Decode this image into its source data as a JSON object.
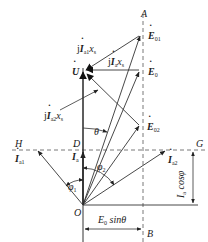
{
  "diagram": {
    "type": "phasor-diagram",
    "points": {
      "O": "O",
      "A": "A",
      "B": "B",
      "D": "D",
      "G": "G",
      "H": "H"
    },
    "phasors": {
      "U": "U",
      "E0": "E",
      "E0_sub": "0",
      "E01": "E",
      "E01_sub": "01",
      "E02": "E",
      "E02_sub": "02",
      "Ia": "I",
      "Ia_sub": "a",
      "Ia1": "I",
      "Ia1_sub": "a1",
      "Ia2": "I",
      "Ia2_sub": "a2"
    },
    "voltage_drops": {
      "jIa1xs_j": "j",
      "jIa1xs_I": "I",
      "jIa1xs_sub": "a1",
      "jIa1xs_x": "x",
      "jIa1xs_xsub": "s",
      "jIaxs_j": "j",
      "jIaxs_I": "I",
      "jIaxs_sub": "a",
      "jIaxs_x": "x",
      "jIaxs_xsub": "s",
      "jIa2xs_j": "j",
      "jIa2xs_I": "I",
      "jIa2xs_sub": "a2",
      "jIa2xs_x": "x",
      "jIa2xs_xsub": "s"
    },
    "angles": {
      "theta": "θ",
      "phi1": "φ",
      "phi1_sub": "1",
      "phi2": "φ",
      "phi2_sub": "2"
    },
    "dimensions": {
      "horizontal_E": "E",
      "horizontal_E_sub": "0",
      "horizontal_rest": " sinθ",
      "vertical_I": "I",
      "vertical_I_sub": "a",
      "vertical_rest": " cosφ"
    },
    "colors": {
      "line": "#333333",
      "dash": "#555555",
      "background": "#ffffff"
    }
  }
}
